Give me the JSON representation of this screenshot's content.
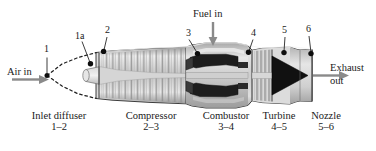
{
  "figure": {
    "background_color": "#ffffff",
    "ink_color": "#1a1a1a",
    "arrow_color": "#8a8a8a"
  },
  "flow_labels": [
    {
      "id": "air-in",
      "text": "Air in",
      "x": 7,
      "y": 66
    },
    {
      "id": "fuel-in",
      "text": "Fuel in",
      "x": 193,
      "y": 10
    },
    {
      "id": "exhaust-out-line1",
      "text": "Exhaust",
      "x": 330,
      "y": 63
    },
    {
      "id": "exhaust-out-line2",
      "text": "out",
      "x": 330,
      "y": 75
    }
  ],
  "station_numbers": [
    {
      "id": "station-1",
      "label": "1",
      "x": 43,
      "y": 44
    },
    {
      "id": "station-1a",
      "label": "1a",
      "x": 75,
      "y": 32
    },
    {
      "id": "station-2",
      "label": "2",
      "x": 106,
      "y": 27
    },
    {
      "id": "station-3",
      "label": "3",
      "x": 188,
      "y": 29
    },
    {
      "id": "station-4",
      "label": "4",
      "x": 252,
      "y": 29
    },
    {
      "id": "station-5",
      "label": "5",
      "x": 283,
      "y": 27
    },
    {
      "id": "station-6",
      "label": "6",
      "x": 307,
      "y": 26
    }
  ],
  "sections": [
    {
      "id": "inlet-diffuser",
      "name": "Inlet diffuser",
      "range": "1–2",
      "cx": 59,
      "y": 112
    },
    {
      "id": "compressor",
      "name": "Compressor",
      "range": "2–3",
      "cx": 151,
      "y": 112
    },
    {
      "id": "combustor",
      "name": "Combustor",
      "range": "3–4",
      "cx": 226,
      "y": 112
    },
    {
      "id": "turbine",
      "name": "Turbine",
      "range": "4–5",
      "cx": 279,
      "y": 112
    },
    {
      "id": "nozzle",
      "name": "Nozzle",
      "range": "5–6",
      "cx": 325,
      "y": 112
    }
  ]
}
